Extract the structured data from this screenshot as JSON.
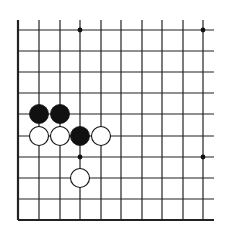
{
  "board": {
    "title": "Go board diagram (lower-left corner section)",
    "columns": 10,
    "rows": 10,
    "x_lines": [
      18,
      39,
      60,
      80,
      101,
      121,
      142,
      162,
      183,
      203
    ],
    "y_lines": [
      30,
      51,
      72,
      93,
      114,
      136,
      157,
      178,
      199,
      220
    ],
    "line_top_extent": 20,
    "line_right_extent": 214,
    "edges": [
      "left",
      "bottom"
    ],
    "line_color": "#222222",
    "background_color": "#ffffff",
    "stone_radius": 9.5
  },
  "star_points": [
    {
      "col": 3,
      "row": 0
    },
    {
      "col": 9,
      "row": 0
    },
    {
      "col": 3,
      "row": 6
    },
    {
      "col": 9,
      "row": 6
    }
  ],
  "stones": [
    {
      "color": "black",
      "col": 1,
      "row": 4
    },
    {
      "color": "black",
      "col": 2,
      "row": 4
    },
    {
      "color": "black",
      "col": 3,
      "row": 5
    },
    {
      "color": "white",
      "col": 1,
      "row": 5
    },
    {
      "color": "white",
      "col": 2,
      "row": 5
    },
    {
      "color": "white",
      "col": 4,
      "row": 5
    },
    {
      "color": "white",
      "col": 3,
      "row": 7
    }
  ]
}
